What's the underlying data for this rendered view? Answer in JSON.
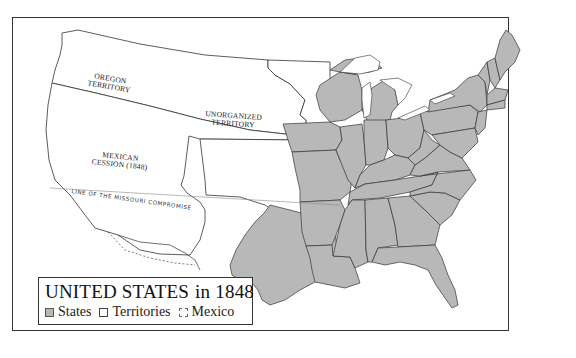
{
  "map": {
    "title": "UNITED STATES",
    "year_label": "in 1848",
    "colors": {
      "states_fill": "#b8b8b8",
      "territory_fill": "#ffffff",
      "border": "#333333",
      "background": "#ffffff"
    },
    "region_labels": [
      {
        "id": "oregon",
        "line1": "OREGON",
        "line2": "TERRITORY"
      },
      {
        "id": "unorganized",
        "line1": "UNORGANIZED",
        "line2": "TERRITORY"
      },
      {
        "id": "mexican-cession",
        "line1": "MEXICAN",
        "line2": "CESSION (1848)"
      }
    ],
    "annotations": {
      "missouri_compromise": "LINE OF THE MISSOURI COMPROMISE"
    }
  },
  "legend": {
    "items": [
      {
        "id": "states",
        "label": "States",
        "swatch": "gray-filled"
      },
      {
        "id": "territories",
        "label": "Territories",
        "swatch": "white"
      },
      {
        "id": "mexico",
        "label": "Mexico",
        "swatch": "dashed"
      }
    ]
  }
}
